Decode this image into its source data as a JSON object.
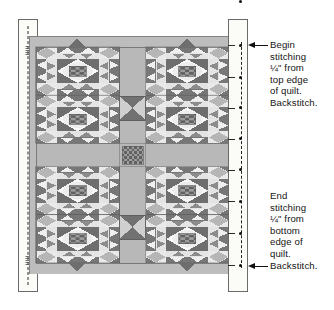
{
  "figure": {
    "type": "quilt-assembly-diagram"
  },
  "colors": {
    "dark": "#6e6e6e",
    "mid": "#a9a9a9",
    "light": "#d8d8d8",
    "white": "#f2f2f2",
    "sashing": "#b9b9b9",
    "border": "#bdbdbd",
    "outline": "#5a5a5a",
    "checker_dark": "#6b6b6b",
    "checker_light": "#a0a0a0",
    "strip_fill": "#fbfbf8",
    "strip_stroke": "#6a6a6a",
    "ink": "#151515"
  },
  "quilt": {
    "name": "quilt-top",
    "blocks_across": 2,
    "blocks_down": 2,
    "has_sashing": true,
    "has_center_checker_square": true,
    "has_outer_border": true
  },
  "left_strip": {
    "name": "left-binding-strip",
    "has_dashed_seam_line": true,
    "nub_count": 2
  },
  "right_strip": {
    "name": "right-binding-strip",
    "has_dashed_seam_line": true,
    "pin_count": 8
  },
  "callouts": [
    {
      "id": "begin",
      "lines": [
        "Begin",
        "stitching",
        "¼\" from",
        "top edge",
        "of quilt.",
        "Backstitch."
      ]
    },
    {
      "id": "end",
      "lines": [
        "End",
        "stitching",
        "¼\" from",
        "bottom",
        "edge of",
        "quilt.",
        "Backstitch."
      ]
    }
  ]
}
